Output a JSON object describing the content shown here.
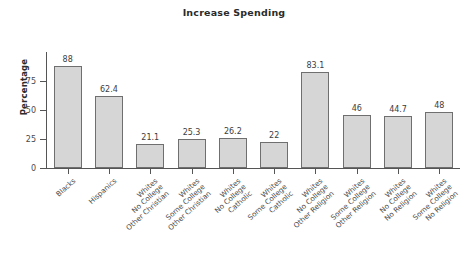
{
  "chart_data": {
    "type": "bar",
    "title": "Increase Spending",
    "xlabel": "",
    "ylabel": "Percentage",
    "ylim": [
      0,
      100
    ],
    "yticks": [
      0,
      25,
      50,
      75
    ],
    "grid": false,
    "legend": null,
    "categories": [
      "Blacks",
      "Hispanics",
      "Whites No College Other Christian",
      "Whites Some College Other Christian",
      "Whites No College Catholic",
      "Whites Some College Catholic",
      "Whites No College Other Religion",
      "Whites Some College Other Religion",
      "Whites No College No Religion",
      "Whites Some College No Religion"
    ],
    "category_lines": [
      [
        "Blacks"
      ],
      [
        "Hispanics"
      ],
      [
        "Whites",
        "No College",
        "Other Christian"
      ],
      [
        "Whites",
        "Some College",
        "Other Christian"
      ],
      [
        "Whites",
        "No College",
        "Catholic"
      ],
      [
        "Whites",
        "Some College",
        "Catholic"
      ],
      [
        "Whites",
        "No College",
        "Other Religion"
      ],
      [
        "Whites",
        "Some College",
        "Other Religion"
      ],
      [
        "Whites",
        "No College",
        "No Religion"
      ],
      [
        "Whites",
        "Some College",
        "No Religion"
      ]
    ],
    "values": [
      88,
      62.4,
      21.1,
      25.3,
      26.2,
      22,
      83.1,
      46,
      44.7,
      48
    ],
    "value_labels": [
      "88",
      "62.4",
      "21.1",
      "25.3",
      "26.2",
      "22",
      "83.1",
      "46",
      "44.7",
      "48"
    ],
    "colors": {
      "bar_fill": "#d6d6d6",
      "bar_border": "#6f6f6f",
      "axis": "#555555",
      "text": "#3d3d3d",
      "background": "#ffffff"
    }
  }
}
